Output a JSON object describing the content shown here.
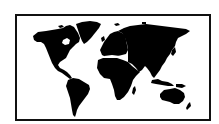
{
  "image": {
    "subject": "world map silhouette",
    "style": "black continents on white background inside black rectangular frame",
    "colors": {
      "land": "#000000",
      "ocean": "#ffffff",
      "frame": "#111111"
    }
  },
  "map": {
    "continents": [
      "North America",
      "Greenland",
      "South America",
      "Europe",
      "Africa",
      "Asia",
      "Australia"
    ]
  }
}
